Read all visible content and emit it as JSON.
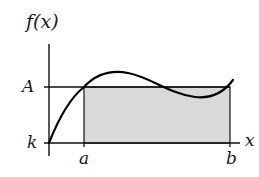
{
  "diagram": {
    "labels": {
      "y_axis": "f(x)",
      "x_axis": "x",
      "mean_value": "A",
      "baseline": "k",
      "interval_start": "a",
      "interval_end": "b"
    },
    "colors": {
      "stroke": "#111111",
      "shaded_region": "#d9d9d9",
      "background": "#ffffff"
    },
    "elements": [
      {
        "type": "axis",
        "name": "y-axis"
      },
      {
        "type": "axis",
        "name": "x-axis"
      },
      {
        "type": "horizontal-line",
        "name": "mean-value-line",
        "level": "A"
      },
      {
        "type": "rectangle",
        "name": "shaded-area",
        "from": "a",
        "to": "b",
        "height": "A - k"
      },
      {
        "type": "curve",
        "name": "function-curve",
        "label": "f(x)"
      }
    ]
  }
}
